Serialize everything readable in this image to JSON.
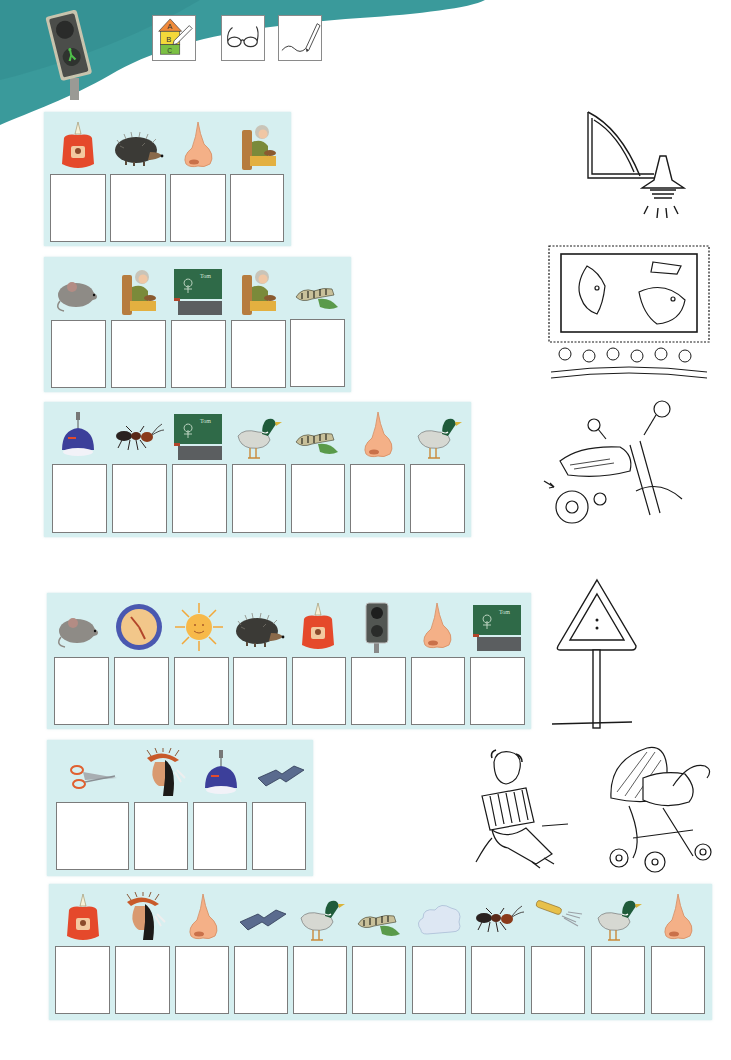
{
  "header": {
    "colors": {
      "teal": "#3a9a9b",
      "teal_dark": "#2f8587",
      "panel_bg": "#d6eff0",
      "box_border": "#7b7b7b"
    },
    "logo": "traffic-light-pedestrian-green",
    "instruction_icons": [
      {
        "name": "abc-house-pencil-icon",
        "label": "ABC",
        "letters": [
          "A",
          "B",
          "C"
        ]
      },
      {
        "name": "glasses-icon",
        "label": ""
      },
      {
        "name": "pencil-writing-icon",
        "label": ""
      }
    ]
  },
  "exercises": [
    {
      "id": 1,
      "pictures": [
        "candle",
        "hedgehog",
        "nose",
        "grandma"
      ],
      "answer_boxes": [
        "",
        "",
        "",
        ""
      ]
    },
    {
      "id": 2,
      "pictures": [
        "mouse",
        "grandma",
        "blackboard",
        "grandma",
        "caterpillar"
      ],
      "answer_boxes": [
        "",
        "",
        "",
        "",
        ""
      ]
    },
    {
      "id": 3,
      "pictures": [
        "lamp",
        "ant",
        "blackboard",
        "duck",
        "caterpillar",
        "nose",
        "duck"
      ],
      "answer_boxes": [
        "",
        "",
        "",
        "",
        "",
        "",
        ""
      ]
    },
    {
      "id": 4,
      "pictures": [
        "mouse",
        "clock",
        "sun",
        "hedgehog",
        "candle",
        "traffic-light",
        "nose",
        "blackboard"
      ],
      "answer_boxes": [
        "",
        "",
        "",
        "",
        "",
        "",
        "",
        ""
      ]
    },
    {
      "id": 5,
      "pictures": [
        "scissors",
        "native-chief",
        "lamp",
        "domino"
      ],
      "answer_boxes": [
        "",
        "",
        "",
        ""
      ]
    },
    {
      "id": 6,
      "pictures": [
        "candle",
        "native-chief",
        "nose",
        "domino",
        "duck",
        "caterpillar",
        "cloud",
        "ant",
        "fork",
        "duck",
        "nose"
      ],
      "answer_boxes": [
        "",
        "",
        "",
        "",
        "",
        "",
        "",
        "",
        "",
        "",
        ""
      ]
    }
  ],
  "sketches": [
    {
      "name": "wall-lamp-sketch",
      "label": "Wandlampe"
    },
    {
      "name": "cinema-sketch",
      "label": "Kino"
    },
    {
      "name": "motorcycle-sketch",
      "label": "Motorrad"
    },
    {
      "name": "warning-sign-sketch",
      "label": "Verkehrsschild"
    },
    {
      "name": "accordion-player-sketch",
      "label": "Akkordeon"
    },
    {
      "name": "stroller-sketch",
      "label": "Kinderwagen"
    }
  ]
}
